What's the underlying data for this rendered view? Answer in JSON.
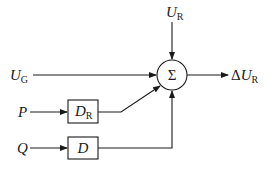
{
  "diagram": {
    "type": "block-diagram",
    "summing_junction": {
      "symbol": "Σ"
    },
    "inputs": {
      "ur": {
        "main": "U",
        "sub": "R"
      },
      "ug": {
        "main": "U",
        "sub": "G"
      },
      "p": {
        "main": "P"
      },
      "q": {
        "main": "Q"
      }
    },
    "blocks": {
      "dr": {
        "main": "D",
        "sub": "R"
      },
      "d": {
        "main": "D"
      }
    },
    "output": {
      "delta": "Δ",
      "main": "U",
      "sub": "R"
    },
    "colors": {
      "line": "#1a1a1a",
      "background": "#ffffff"
    }
  }
}
